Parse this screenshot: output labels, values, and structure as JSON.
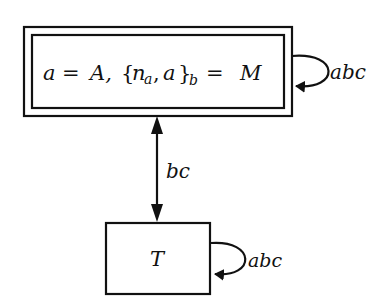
{
  "diagram": {
    "type": "state-transition",
    "nodes": [
      {
        "id": "state-1",
        "label_parts": {
          "a": "a",
          "eq1": "=",
          "A": "A,",
          "lbrace": "{",
          "n": "n",
          "n_sub": "a",
          "comma": ",",
          "a2": "a",
          "rbrace": "}",
          "b_sub": "b",
          "eq2": "=",
          "M": "M"
        },
        "label": "a = A, {n_a, a}_b = M",
        "shape": "double-rectangle",
        "self_loop_label": "abc"
      },
      {
        "id": "state-2",
        "label": "T",
        "shape": "rectangle",
        "self_loop_label": "abc"
      }
    ],
    "edges": [
      {
        "from": "state-1",
        "to": "state-2",
        "label": "bc",
        "direction": "bidirectional"
      },
      {
        "from": "state-1",
        "to": "state-1",
        "label": "abc"
      },
      {
        "from": "state-2",
        "to": "state-2",
        "label": "abc"
      }
    ],
    "colors": {
      "stroke": "#111111",
      "background": "#ffffff"
    }
  }
}
